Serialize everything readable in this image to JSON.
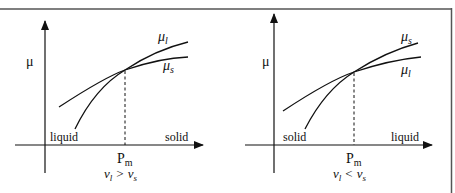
{
  "figure": {
    "colors": {
      "line": "#111111",
      "frame": "#555555",
      "background": "#ffffff"
    },
    "panels": [
      {
        "id": "left",
        "y_axis_label": "μ",
        "curve_upper_label": {
          "main": "μ",
          "sub": "l"
        },
        "curve_lower_label": {
          "main": "μ",
          "sub": "s"
        },
        "left_phase_label": "liquid",
        "right_phase_label": "solid",
        "x_marker": {
          "main": "P",
          "sub": "m"
        },
        "condition": {
          "a": "v",
          "a_sub": "l",
          "op": ">",
          "b": "v",
          "b_sub": "s"
        }
      },
      {
        "id": "right",
        "y_axis_label": "μ",
        "curve_upper_label": {
          "main": "μ",
          "sub": "s"
        },
        "curve_lower_label": {
          "main": "μ",
          "sub": "l"
        },
        "left_phase_label": "solid",
        "right_phase_label": "liquid",
        "x_marker": {
          "main": "P",
          "sub": "m"
        },
        "condition": {
          "a": "v",
          "a_sub": "l",
          "op": "<",
          "b": "v",
          "b_sub": "s"
        }
      }
    ]
  }
}
